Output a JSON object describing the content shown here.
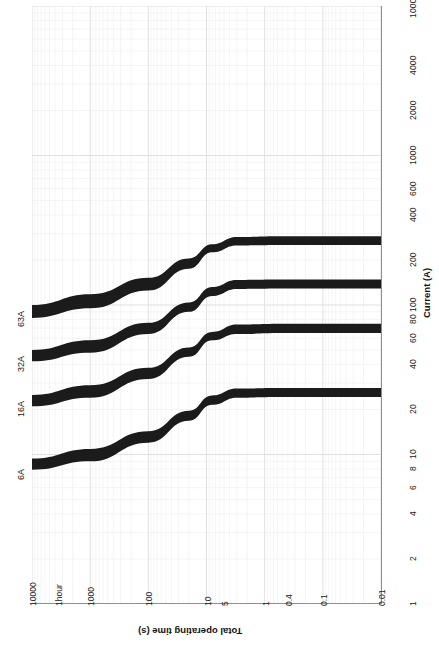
{
  "chart_data": {
    "type": "line",
    "title": "",
    "orientation": "rotated-90",
    "xlabel": "Total operating time (s)",
    "ylabel": "Current (A)",
    "x_scale": "log",
    "y_scale": "log",
    "grid": "log-log graph paper, minor gridlines on",
    "xlim": [
      10000,
      0.01
    ],
    "ylim": [
      1,
      10000
    ],
    "x_ticks": [
      "10000",
      "1hour",
      "1000",
      "100",
      "10",
      "5",
      "1",
      "0.4",
      "0.1",
      "0.01"
    ],
    "x_tick_values": [
      10000,
      3600,
      1000,
      100,
      10,
      5,
      1,
      0.4,
      0.1,
      0.01
    ],
    "y_ticks": [
      "1",
      "2",
      "4",
      "6",
      "8",
      "10",
      "20",
      "40",
      "60",
      "80",
      "100",
      "200",
      "400",
      "600",
      "1000",
      "2000",
      "4000",
      "10000"
    ],
    "y_tick_values": [
      1,
      2,
      4,
      6,
      8,
      10,
      20,
      40,
      60,
      80,
      100,
      200,
      400,
      600,
      1000,
      2000,
      4000,
      10000
    ],
    "legend_position": "inline-left-of-curves",
    "series": [
      {
        "name": "63A",
        "label": "63A",
        "band": true,
        "thermal_start_current": 90,
        "magnetic_trip_current": 250,
        "magnetic_trip_time": 0.01,
        "points_lower": [
          [
            10000,
            82
          ],
          [
            1000,
            95
          ],
          [
            100,
            125
          ],
          [
            20,
            175
          ],
          [
            8,
            225
          ],
          [
            3,
            250
          ],
          [
            0.5,
            252
          ],
          [
            0.01,
            252
          ]
        ],
        "points_upper": [
          [
            10000,
            100
          ],
          [
            1000,
            118
          ],
          [
            100,
            152
          ],
          [
            20,
            205
          ],
          [
            8,
            255
          ],
          [
            3,
            285
          ],
          [
            0.5,
            288
          ],
          [
            0.01,
            288
          ]
        ]
      },
      {
        "name": "32A",
        "label": "32A",
        "band": true,
        "thermal_start_current": 46,
        "magnetic_trip_current": 128,
        "magnetic_trip_time": 0.01,
        "points_lower": [
          [
            10000,
            42
          ],
          [
            1000,
            48
          ],
          [
            100,
            64
          ],
          [
            20,
            90
          ],
          [
            8,
            115
          ],
          [
            3,
            128
          ],
          [
            0.5,
            129
          ],
          [
            0.01,
            129
          ]
        ],
        "points_upper": [
          [
            10000,
            50
          ],
          [
            1000,
            58
          ],
          [
            100,
            76
          ],
          [
            20,
            104
          ],
          [
            8,
            132
          ],
          [
            3,
            147
          ],
          [
            0.5,
            148
          ],
          [
            0.01,
            148
          ]
        ]
      },
      {
        "name": "16A",
        "label": "16A",
        "band": true,
        "thermal_start_current": 23,
        "magnetic_trip_current": 64,
        "magnetic_trip_time": 0.01,
        "points_lower": [
          [
            10000,
            21
          ],
          [
            1000,
            24
          ],
          [
            100,
            32
          ],
          [
            20,
            45
          ],
          [
            8,
            58
          ],
          [
            3,
            64
          ],
          [
            0.5,
            65
          ],
          [
            0.01,
            65
          ]
        ],
        "points_upper": [
          [
            10000,
            25
          ],
          [
            1000,
            29
          ],
          [
            100,
            38
          ],
          [
            20,
            52
          ],
          [
            8,
            66
          ],
          [
            3,
            74
          ],
          [
            0.5,
            75
          ],
          [
            0.01,
            75
          ]
        ]
      },
      {
        "name": "6A",
        "label": "6A",
        "band": true,
        "thermal_start_current": 8.6,
        "magnetic_trip_current": 24,
        "magnetic_trip_time": 0.01,
        "points_lower": [
          [
            10000,
            7.9
          ],
          [
            1000,
            9.0
          ],
          [
            100,
            12.0
          ],
          [
            20,
            16.8
          ],
          [
            8,
            21.5
          ],
          [
            3,
            24.0
          ],
          [
            0.5,
            24.2
          ],
          [
            0.01,
            24.2
          ]
        ],
        "points_upper": [
          [
            10000,
            9.4
          ],
          [
            1000,
            10.9
          ],
          [
            100,
            14.3
          ],
          [
            20,
            19.6
          ],
          [
            8,
            24.8
          ],
          [
            3,
            27.6
          ],
          [
            0.5,
            27.8
          ],
          [
            0.01,
            27.8
          ]
        ]
      }
    ]
  },
  "axes": {
    "current": {
      "title": "Current (A)",
      "ticks": [
        {
          "label": "1",
          "value": 1
        },
        {
          "label": "2",
          "value": 2
        },
        {
          "label": "4",
          "value": 4
        },
        {
          "label": "6",
          "value": 6
        },
        {
          "label": "8",
          "value": 8
        },
        {
          "label": "10",
          "value": 10
        },
        {
          "label": "20",
          "value": 20
        },
        {
          "label": "40",
          "value": 40
        },
        {
          "label": "60",
          "value": 60
        },
        {
          "label": "80",
          "value": 80
        },
        {
          "label": "100",
          "value": 100
        },
        {
          "label": "200",
          "value": 200
        },
        {
          "label": "400",
          "value": 400
        },
        {
          "label": "600",
          "value": 600
        },
        {
          "label": "1000",
          "value": 1000
        },
        {
          "label": "2000",
          "value": 2000
        },
        {
          "label": "4000",
          "value": 4000
        },
        {
          "label": "10000",
          "value": 10000
        }
      ]
    },
    "time": {
      "title": "Total operating time (s)",
      "ticks": [
        {
          "label": "10000",
          "value": 10000
        },
        {
          "label": "1hour",
          "value": 3600
        },
        {
          "label": "1000",
          "value": 1000
        },
        {
          "label": "100",
          "value": 100
        },
        {
          "label": "10",
          "value": 10
        },
        {
          "label": "5",
          "value": 5
        },
        {
          "label": "1",
          "value": 1
        },
        {
          "label": "0.4",
          "value": 0.4
        },
        {
          "label": "0.1",
          "value": 0.1
        },
        {
          "label": "0.01",
          "value": 0.01
        }
      ]
    }
  },
  "curve_labels": [
    {
      "label": "63A"
    },
    {
      "label": "32A"
    },
    {
      "label": "16A"
    },
    {
      "label": "6A"
    }
  ],
  "colors": {
    "band": "#1b1b1b",
    "background": "#ffffff",
    "grid_minor": "#ececed",
    "grid_major": "#d8d8da",
    "axis": "#8f8f93",
    "text": "#1c1c1c"
  }
}
